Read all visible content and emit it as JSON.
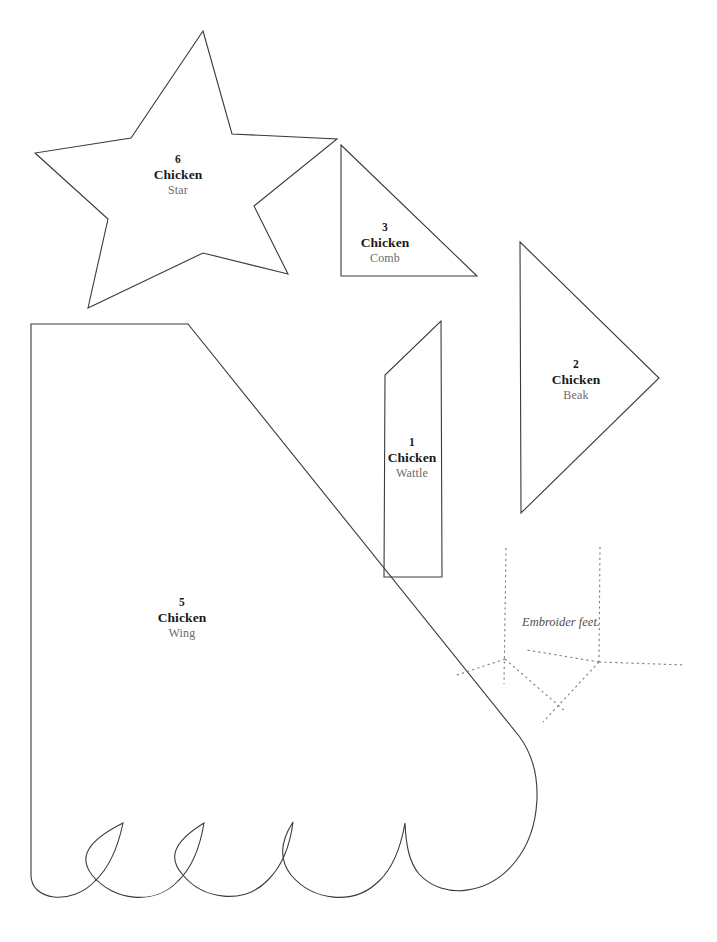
{
  "sheet": {
    "background_color": "#ffffff",
    "outline_color": "#3a3a3a",
    "stitch_color": "#7c7c7c",
    "label_number_color": "#1a1a1a",
    "label_part_color": "#6b6b6b"
  },
  "pieces": [
    {
      "id": "star",
      "number": "6",
      "category": "Chicken",
      "part": "Star",
      "label_x": 178,
      "label_y": 175,
      "shape": "star-5-point",
      "path": "M 203 31 L 232 134 L 337 139 L 254 206 L 288 274 L 203 253 L 88 308 L 108 219 L 35 153 L 131 138 Z"
    },
    {
      "id": "comb",
      "number": "3",
      "category": "Chicken",
      "part": "Comb",
      "label_x": 385,
      "label_y": 243,
      "shape": "right-triangle",
      "path": "M 341 145 L 477 276 L 341 276 Z"
    },
    {
      "id": "beak",
      "number": "2",
      "category": "Chicken",
      "part": "Beak",
      "label_x": 576,
      "label_y": 380,
      "shape": "triangle-pointing-right",
      "path": "M 520 242 L 659 378 L 521 513 Z"
    },
    {
      "id": "wattle",
      "number": "1",
      "category": "Chicken",
      "part": "Wattle",
      "label_x": 412,
      "label_y": 458,
      "shape": "angled-strip",
      "path": "M 441 321 L 442 577 L 384 577 L 385 375 Z"
    },
    {
      "id": "wing",
      "number": "5",
      "category": "Chicken",
      "part": "Wing",
      "label_x": 182,
      "label_y": 618,
      "shape": "scalloped-wing",
      "path": "M 31 324 L 188 324 L 519 736 C 546 772 541 830 515 862 C 489 894 444 901 419 874 C 409 862 406 845 405 823 C 401 846 394 867 379 881 C 354 906 313 901 291 875 C 281 862 278 845 293 822 C 290 846 282 866 268 880 C 244 905 203 900 182 874 C 171 861 168 845 204 823 C 200 847 193 867 178 881 C 155 906 113 901 92 875 C 82 862 79 845 123 823 C 118 847 110 867 95 881 C 72 906 30 901 31 874 Z"
    }
  ],
  "feet": {
    "note": "Embroider feet.",
    "note_x": 561,
    "note_y": 622,
    "strokes": [
      "M 506 548 L 504 684",
      "M 505 659 L 454 676",
      "M 505 659 L 566 712",
      "M 600 547 L 599 662",
      "M 599 662 L 527 650",
      "M 599 662 L 685 665",
      "M 599 662 L 543 722"
    ]
  }
}
